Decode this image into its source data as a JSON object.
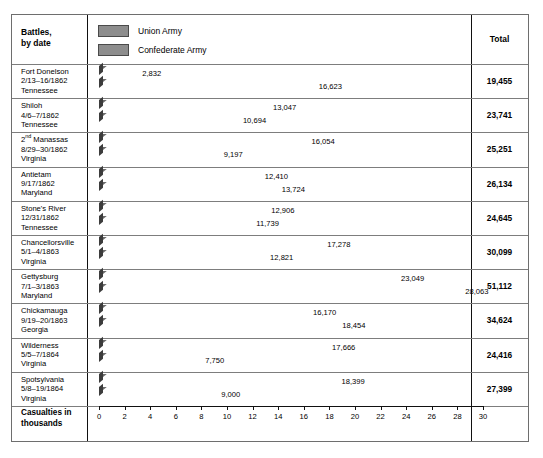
{
  "headers": {
    "battles": "Battles,\nby date",
    "battles_line1": "Battles,",
    "battles_line2": "by date",
    "total": "Total"
  },
  "legend": {
    "items": [
      {
        "label": "Union Army",
        "key": "union",
        "color": "#8d8d8d"
      },
      {
        "label": "Confederate Army",
        "key": "confederate",
        "color": "#8d8d8d"
      }
    ]
  },
  "axis_caption_line1": "Casualties in",
  "axis_caption_line2": "thousands",
  "chart_data": {
    "type": "bar",
    "orientation": "horizontal",
    "title": "",
    "xlabel": "Casualties in thousands",
    "ylabel": "Battles, by date",
    "xlim": [
      0,
      30
    ],
    "xticks": [
      0,
      2,
      4,
      6,
      8,
      10,
      12,
      14,
      16,
      18,
      20,
      22,
      24,
      26,
      28,
      30
    ],
    "grid": false,
    "legend_position": "top-left",
    "units": "thousands",
    "categories": [
      "Fort Donelson 2/13–16/1862 Tennessee",
      "Shiloh 4/6–7/1862 Tennessee",
      "2nd Manassas 8/29–30/1862 Virginia",
      "Antietam 9/17/1862 Maryland",
      "Stone's River 12/31/1862 Tennessee",
      "Chancellorsville 5/1–4/1863 Virginia",
      "Gettysburg 7/1–3/1863 Maryland",
      "Chickamauga 9/19–20/1863 Georgia",
      "Wilderness 5/5–7/1864 Virginia",
      "Spotsylvania 5/8–19/1864 Virginia"
    ],
    "series": [
      {
        "name": "Union Army",
        "values": [
          2832,
          13047,
          16054,
          12410,
          12906,
          17278,
          23049,
          16170,
          17666,
          18399
        ]
      },
      {
        "name": "Confederate Army",
        "values": [
          16623,
          10694,
          9197,
          13724,
          11739,
          12821,
          28063,
          18454,
          7750,
          9000
        ]
      }
    ],
    "totals": [
      19455,
      23741,
      25251,
      26134,
      24645,
      30099,
      51112,
      34624,
      24416,
      27399
    ]
  },
  "rows": [
    {
      "name": "Fort Donelson",
      "name_prefix": "",
      "name_sup": "",
      "date": "2/13–16/1862",
      "place": "Tennessee",
      "union": 2832,
      "confederate": 16623,
      "union_label": "2,832",
      "confederate_label": "16,623",
      "total_label": "19,455"
    },
    {
      "name": "Shiloh",
      "name_prefix": "",
      "name_sup": "",
      "date": "4/6–7/1862",
      "place": "Tennessee",
      "union": 13047,
      "confederate": 10694,
      "union_label": "13,047",
      "confederate_label": "10,694",
      "total_label": "23,741"
    },
    {
      "name": "2nd Manassas",
      "name_prefix": "2",
      "name_sup": "nd",
      "name_rest": " Manassas",
      "date": "8/29–30/1862",
      "place": "Virginia",
      "union": 16054,
      "confederate": 9197,
      "union_label": "16,054",
      "confederate_label": "9,197",
      "total_label": "25,251"
    },
    {
      "name": "Antietam",
      "name_prefix": "",
      "name_sup": "",
      "date": "9/17/1862",
      "place": "Maryland",
      "union": 12410,
      "confederate": 13724,
      "union_label": "12,410",
      "confederate_label": "13,724",
      "total_label": "26,134"
    },
    {
      "name": "Stone's River",
      "name_prefix": "",
      "name_sup": "",
      "date": "12/31/1862",
      "place": "Tennessee",
      "union": 12906,
      "confederate": 11739,
      "union_label": "12,906",
      "confederate_label": "11,739",
      "total_label": "24,645"
    },
    {
      "name": "Chancellorsville",
      "name_prefix": "",
      "name_sup": "",
      "date": "5/1–4/1863",
      "place": "Virginia",
      "union": 17278,
      "confederate": 12821,
      "union_label": "17,278",
      "confederate_label": "12,821",
      "total_label": "30,099"
    },
    {
      "name": "Gettysburg",
      "name_prefix": "",
      "name_sup": "",
      "date": "7/1–3/1863",
      "place": "Maryland",
      "union": 23049,
      "confederate": 28063,
      "union_label": "23,049",
      "confederate_label": "28,063",
      "total_label": "51,112"
    },
    {
      "name": "Chickamauga",
      "name_prefix": "",
      "name_sup": "",
      "date": "9/19–20/1863",
      "place": "Georgia",
      "union": 16170,
      "confederate": 18454,
      "union_label": "16,170",
      "confederate_label": "18,454",
      "total_label": "34,624"
    },
    {
      "name": "Wilderness",
      "name_prefix": "",
      "name_sup": "",
      "date": "5/5–7/1864",
      "place": "Virginia",
      "union": 17666,
      "confederate": 7750,
      "union_label": "17,666",
      "confederate_label": "7,750",
      "total_label": "24,416"
    },
    {
      "name": "Spotsylvania",
      "name_prefix": "",
      "name_sup": "",
      "date": "5/8–19/1864",
      "place": "Virginia",
      "union": 18399,
      "confederate": 9000,
      "union_label": "18,399",
      "confederate_label": "9,000",
      "total_label": "27,399"
    }
  ]
}
